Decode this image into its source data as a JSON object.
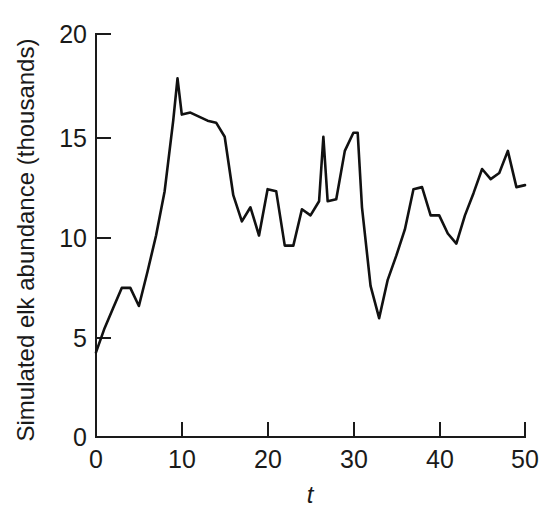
{
  "chart_data": {
    "type": "line",
    "title": "",
    "xlabel": "t",
    "ylabel": "Simulated elk abundance (thousands)",
    "xlim": [
      0,
      50
    ],
    "ylim": [
      0,
      20
    ],
    "xticks": [
      0,
      10,
      20,
      30,
      40,
      50
    ],
    "yticks": [
      0,
      5,
      10,
      15,
      20
    ],
    "xtick_labels": [
      "0",
      "10",
      "20",
      "30",
      "40",
      "50"
    ],
    "ytick_labels": [
      "0",
      "5",
      "10",
      "15",
      "20"
    ],
    "grid": false,
    "legend": false,
    "legend_position": "none",
    "line_color": "#111111",
    "series": [
      {
        "name": "Simulated elk abundance",
        "x": [
          0,
          1,
          2,
          3,
          4,
          5,
          6,
          7,
          8,
          9,
          9.5,
          10,
          11,
          12,
          13,
          14,
          15,
          16,
          17,
          18,
          19,
          20,
          21,
          22,
          23,
          24,
          25,
          26,
          26.5,
          27,
          28,
          29,
          30,
          30.5,
          31,
          32,
          33,
          34,
          35,
          36,
          37,
          38,
          39,
          40,
          41,
          42,
          43,
          44,
          45,
          46,
          47,
          48,
          49,
          50
        ],
        "y": [
          4.2,
          5.4,
          6.4,
          7.4,
          7.4,
          6.5,
          8.2,
          10.0,
          12.2,
          15.7,
          17.8,
          16.0,
          16.1,
          15.9,
          15.7,
          15.6,
          14.9,
          12.0,
          10.7,
          11.4,
          10.0,
          12.3,
          12.2,
          9.5,
          9.5,
          11.3,
          11.0,
          11.7,
          14.9,
          11.7,
          11.8,
          14.2,
          15.1,
          15.1,
          11.4,
          7.5,
          5.9,
          7.8,
          9.0,
          10.3,
          12.3,
          12.4,
          11.0,
          11.0,
          10.1,
          9.6,
          11.0,
          12.1,
          13.3,
          12.8,
          13.1,
          14.2,
          12.4,
          12.5
        ]
      }
    ]
  },
  "axis_geometry": {
    "x_origin_px": 96,
    "y_origin_px": 437,
    "x_per_unit_px": 8.58,
    "y_per_unit_px": 20.15
  }
}
